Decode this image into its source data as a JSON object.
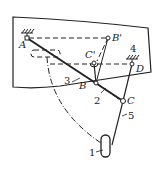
{
  "diagram": {
    "title": "",
    "colors": {
      "ink": "#222222",
      "background": "#ffffff"
    },
    "points": [
      {
        "id": "A",
        "label": "A"
      },
      {
        "id": "B",
        "label": "B"
      },
      {
        "id": "C",
        "label": "C"
      },
      {
        "id": "D",
        "label": "D"
      },
      {
        "id": "B_prime",
        "label": "B'"
      },
      {
        "id": "C_prime",
        "label": "C'"
      }
    ],
    "parts": [
      {
        "id": "1",
        "label": "1",
        "name": "wheel"
      },
      {
        "id": "2",
        "label": "2",
        "name": "link BC"
      },
      {
        "id": "3",
        "label": "3",
        "name": "link AC"
      },
      {
        "id": "4",
        "label": "4",
        "name": "fixed support D"
      },
      {
        "id": "5",
        "label": "5",
        "name": "link D-wheel"
      }
    ],
    "ground_supports": [
      "A",
      "D"
    ]
  }
}
